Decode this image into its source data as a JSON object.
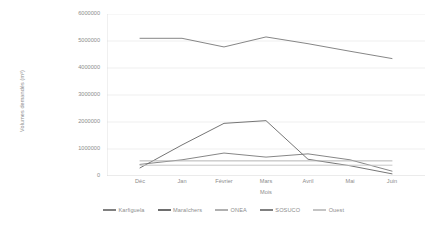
{
  "chart_data": {
    "type": "line",
    "title": "",
    "xlabel": "Mois",
    "ylabel": "Volumes demandés (m³)",
    "categories": [
      "Déc",
      "Jan",
      "Février",
      "Mars",
      "Avril",
      "Mai",
      "Juin"
    ],
    "ylim": [
      0,
      6000000
    ],
    "ytick_values": [
      6000000,
      5000000,
      4000000,
      3000000,
      2000000,
      1000000,
      0
    ],
    "ytick_labels": [
      "6000000",
      "5000000",
      "4000000",
      "3000000",
      "2000000",
      "1000000",
      "0"
    ],
    "grid": true,
    "legend_position": "bottom",
    "series": [
      {
        "name": "Karfiguela",
        "color": "#808080",
        "values": [
          430000,
          600000,
          850000,
          700000,
          820000,
          600000,
          180000
        ]
      },
      {
        "name": "Maraîchers",
        "color": "#6e6e6e",
        "values": [
          300000,
          1150000,
          1950000,
          2050000,
          620000,
          380000,
          80000
        ]
      },
      {
        "name": "ONEA",
        "color": "#b0b0b0",
        "values": [
          560000,
          560000,
          560000,
          560000,
          560000,
          560000,
          560000
        ]
      },
      {
        "name": "SOSUCO",
        "color": "#808080",
        "values": [
          5100000,
          5100000,
          4780000,
          5150000,
          4900000,
          4620000,
          4350000
        ]
      },
      {
        "name": "Ouest",
        "color": "#c4c4c4",
        "values": [
          400000,
          400000,
          400000,
          400000,
          400000,
          400000,
          400000
        ]
      }
    ]
  },
  "legend": {
    "items": [
      {
        "label": "Karfiguela",
        "color": "#808080"
      },
      {
        "label": "Maraîchers",
        "color": "#6e6e6e"
      },
      {
        "label": "ONEA",
        "color": "#b0b0b0"
      },
      {
        "label": "SOSUCO",
        "color": "#808080"
      },
      {
        "label": "Ouest",
        "color": "#c4c4c4"
      }
    ]
  },
  "colors": {
    "axis": "#d9d9d9",
    "grid": "#e8e8e8",
    "text": "#8c8c8c",
    "background": "#ffffff"
  }
}
